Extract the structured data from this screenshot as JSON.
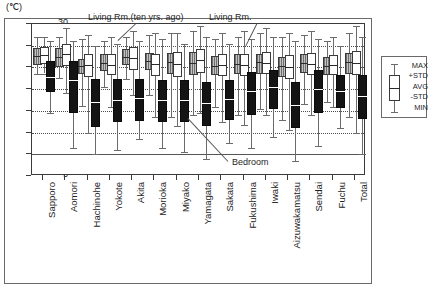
{
  "axis": {
    "unit_label": "(℃)",
    "y_ticks": [
      "30",
      "25",
      "20",
      "15",
      "10",
      "5",
      "0",
      "-5"
    ],
    "y_min": -5,
    "y_max": 30
  },
  "legend": {
    "items": [
      "MAX",
      "+STD",
      "AVG",
      "-STD",
      "MIN"
    ]
  },
  "annotations": [
    {
      "text": "Living Rm.(ten yrs. ago)"
    },
    {
      "text": "Living Rm."
    },
    {
      "text": "Bedroom"
    }
  ],
  "chart_data": {
    "type": "box",
    "title": "",
    "xlabel": "",
    "ylabel": "(℃)",
    "ylim": [
      -5,
      30
    ],
    "grid": true,
    "legend_position": "right",
    "stat_labels": [
      "MAX",
      "+STD",
      "AVG",
      "-STD",
      "MIN"
    ],
    "categories": [
      "Sapporo",
      "Aomori",
      "Hachinohe",
      "Yokote",
      "Akita",
      "Morioka",
      "Miyako",
      "Yamagata",
      "Sakata",
      "Fukushima",
      "Iwaki",
      "Aizuwakamatsu",
      "Sendai",
      "Fuchu",
      "Total"
    ],
    "series": [
      {
        "name": "Living Rm.(ten yrs. ago)",
        "fill": "gray-hatched",
        "boxes": [
          {
            "max": 27.0,
            "std_hi": 24.5,
            "avg": 22.6,
            "std_lo": 20.6,
            "min": 18.4
          },
          {
            "max": 27.0,
            "std_hi": 24.4,
            "avg": 22.3,
            "std_lo": 20.2,
            "min": 17.5
          },
          {
            "max": 26.5,
            "std_hi": 22.0,
            "avg": 20.4,
            "std_lo": 18.6,
            "min": 11.2
          },
          {
            "max": 26.0,
            "std_hi": 23.1,
            "avg": 21.0,
            "std_lo": 19.2,
            "min": 15.6
          },
          {
            "max": 27.0,
            "std_hi": 24.2,
            "avg": 22.5,
            "std_lo": 20.6,
            "min": 17.3
          },
          {
            "max": 27.5,
            "std_hi": 23.3,
            "avg": 21.4,
            "std_lo": 19.4,
            "min": 13.7
          },
          {
            "max": 28.0,
            "std_hi": 23.3,
            "avg": 21.3,
            "std_lo": 18.5,
            "min": 8.5
          },
          {
            "max": 28.5,
            "std_hi": 23.6,
            "avg": 21.0,
            "std_lo": 18.3,
            "min": 9.0
          },
          {
            "max": 26.5,
            "std_hi": 22.6,
            "avg": 20.4,
            "std_lo": 18.2,
            "min": 11.0
          },
          {
            "max": 27.0,
            "std_hi": 23.0,
            "avg": 20.8,
            "std_lo": 18.5,
            "min": 9.0
          },
          {
            "max": 28.0,
            "std_hi": 23.2,
            "avg": 21.2,
            "std_lo": 18.4,
            "min": 10.5
          },
          {
            "max": 27.0,
            "std_hi": 22.4,
            "avg": 20.3,
            "std_lo": 17.8,
            "min": 8.0
          },
          {
            "max": 27.5,
            "std_hi": 23.0,
            "avg": 21.0,
            "std_lo": 18.6,
            "min": 11.5
          },
          {
            "max": 26.0,
            "std_hi": 22.4,
            "avg": 20.4,
            "std_lo": 18.2,
            "min": 12.0
          },
          {
            "max": 28.0,
            "std_hi": 23.4,
            "avg": 21.2,
            "std_lo": 18.6,
            "min": 8.5
          }
        ]
      },
      {
        "name": "Living Rm.",
        "fill": "white",
        "boxes": [
          {
            "max": 27.0,
            "std_hi": 24.6,
            "avg": 22.8,
            "std_lo": 20.8,
            "min": 18.6
          },
          {
            "max": 29.0,
            "std_hi": 25.5,
            "avg": 23.0,
            "std_lo": 20.3,
            "min": 14.2
          },
          {
            "max": 27.5,
            "std_hi": 23.0,
            "avg": 20.5,
            "std_lo": 17.8,
            "min": 4.8
          },
          {
            "max": 27.0,
            "std_hi": 23.0,
            "avg": 20.6,
            "std_lo": 18.2,
            "min": 11.0
          },
          {
            "max": 28.5,
            "std_hi": 24.7,
            "avg": 22.2,
            "std_lo": 19.4,
            "min": 13.6
          },
          {
            "max": 28.0,
            "std_hi": 23.2,
            "avg": 20.8,
            "std_lo": 18.0,
            "min": 8.5
          },
          {
            "max": 28.0,
            "std_hi": 23.5,
            "avg": 20.8,
            "std_lo": 17.8,
            "min": 6.5
          },
          {
            "max": 29.5,
            "std_hi": 24.2,
            "avg": 21.6,
            "std_lo": 18.8,
            "min": 9.5
          },
          {
            "max": 28.0,
            "std_hi": 23.0,
            "avg": 20.6,
            "std_lo": 18.0,
            "min": 7.5
          },
          {
            "max": 28.5,
            "std_hi": 23.2,
            "avg": 20.6,
            "std_lo": 18.0,
            "min": 6.8
          },
          {
            "max": 29.0,
            "std_hi": 23.6,
            "avg": 21.0,
            "std_lo": 18.4,
            "min": 9.0
          },
          {
            "max": 28.0,
            "std_hi": 22.8,
            "avg": 20.0,
            "std_lo": 17.4,
            "min": 5.5
          },
          {
            "max": 28.5,
            "std_hi": 23.4,
            "avg": 20.8,
            "std_lo": 18.2,
            "min": 9.0
          },
          {
            "max": 27.0,
            "std_hi": 22.8,
            "avg": 20.5,
            "std_lo": 18.2,
            "min": 11.0
          },
          {
            "max": 29.5,
            "std_hi": 23.8,
            "avg": 21.0,
            "std_lo": 18.2,
            "min": 5.0
          }
        ]
      },
      {
        "name": "Bedroom",
        "fill": "black",
        "boxes": [
          {
            "max": 26.0,
            "std_hi": 21.4,
            "avg": 17.8,
            "std_lo": 14.4,
            "min": 9.5
          },
          {
            "max": 26.0,
            "std_hi": 21.5,
            "avg": 17.0,
            "std_lo": 9.4,
            "min": 1.5
          },
          {
            "max": 25.0,
            "std_hi": 17.4,
            "avg": 12.0,
            "std_lo": 6.2,
            "min": 0.0
          },
          {
            "max": 25.5,
            "std_hi": 17.3,
            "avg": 12.6,
            "std_lo": 7.4,
            "min": 1.0
          },
          {
            "max": 26.0,
            "std_hi": 17.4,
            "avg": 13.0,
            "std_lo": 7.6,
            "min": 3.5
          },
          {
            "max": 26.5,
            "std_hi": 17.2,
            "avg": 12.4,
            "std_lo": 7.4,
            "min": 1.5
          },
          {
            "max": 25.5,
            "std_hi": 17.0,
            "avg": 12.5,
            "std_lo": 7.5,
            "min": 0.5
          },
          {
            "max": 27.0,
            "std_hi": 16.6,
            "avg": 11.8,
            "std_lo": 6.4,
            "min": -1.0
          },
          {
            "max": 25.5,
            "std_hi": 17.2,
            "avg": 12.8,
            "std_lo": 8.0,
            "min": 2.5
          },
          {
            "max": 26.5,
            "std_hi": 19.0,
            "avg": 14.6,
            "std_lo": 9.0,
            "min": 1.5
          },
          {
            "max": 27.0,
            "std_hi": 19.5,
            "avg": 15.4,
            "std_lo": 10.5,
            "min": 4.0
          },
          {
            "max": 26.0,
            "std_hi": 16.6,
            "avg": 11.4,
            "std_lo": 6.0,
            "min": -1.5
          },
          {
            "max": 26.5,
            "std_hi": 19.4,
            "avg": 15.0,
            "std_lo": 9.6,
            "min": 2.0
          },
          {
            "max": 25.0,
            "std_hi": 18.2,
            "avg": 14.6,
            "std_lo": 10.6,
            "min": 6.0
          },
          {
            "max": 27.0,
            "std_hi": 18.2,
            "avg": 13.4,
            "std_lo": 8.2,
            "min": 0.0
          }
        ]
      }
    ]
  }
}
